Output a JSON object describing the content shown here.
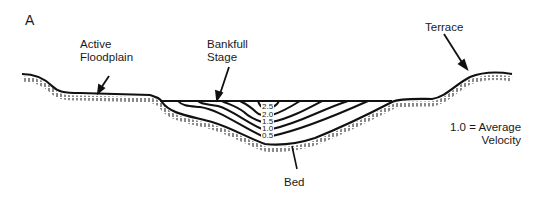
{
  "panel_label": "A",
  "labels": {
    "active_floodplain": [
      "Active",
      "Floodplain"
    ],
    "bankfull_stage": [
      "Bankfull",
      "Stage"
    ],
    "terrace": "Terrace",
    "bed": "Bed",
    "legend": [
      "1.0 = Average",
      "Velocity"
    ]
  },
  "isovels": [
    "2.5",
    "2.0",
    "1.5",
    "1.0",
    "0.5"
  ],
  "colors": {
    "line": "#111111",
    "background": "#ffffff"
  }
}
